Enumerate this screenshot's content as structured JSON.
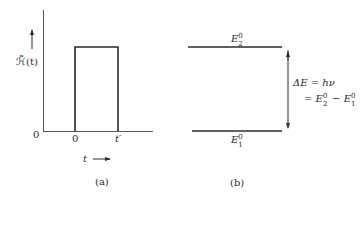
{
  "panel_a": {
    "caption": "(a)",
    "y_axis_label": "ℋ̃(t)",
    "y_axis_label_var": "t",
    "y_origin_label": "0",
    "x_tick_start": "0",
    "x_tick_end": "t′",
    "x_axis_label": "t",
    "x_axis_arrow": "⟶",
    "pulse": {
      "start": "0",
      "end": "t′",
      "shape": "rectangular"
    }
  },
  "panel_b": {
    "caption": "(b)",
    "upper_level": {
      "symbol": "E",
      "superscript": "0",
      "subscript": "2"
    },
    "lower_level": {
      "symbol": "E",
      "superscript": "0",
      "subscript": "1"
    },
    "energy_gap_line1": "ΔE = hν",
    "energy_gap_line2_prefix": "=",
    "energy_gap_line2_minus": "−"
  },
  "colors": {
    "line": "#2a2a2a",
    "background": "#ffffff"
  }
}
